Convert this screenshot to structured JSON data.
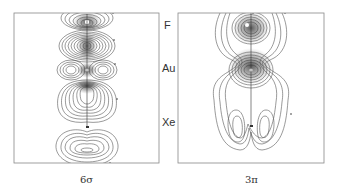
{
  "figure": {
    "panels": [
      {
        "id": "6sigma",
        "caption": "6σ"
      },
      {
        "id": "3pi",
        "caption": "3π"
      }
    ],
    "atom_labels": [
      "F",
      "Au",
      "Xe"
    ],
    "colors": {
      "contour": "#444444",
      "frame": "#888888",
      "background": "#ffffff"
    }
  }
}
